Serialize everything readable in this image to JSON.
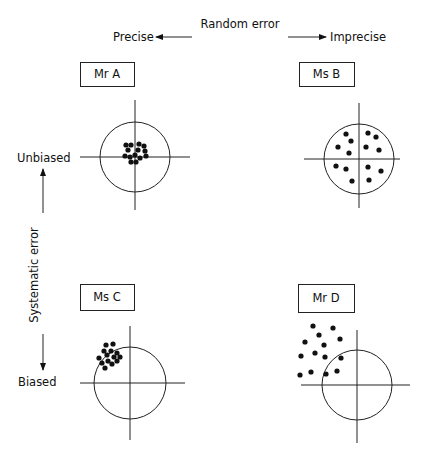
{
  "title": "Random error",
  "axes": {
    "random_error": {
      "label": "Random error",
      "left": "Precise",
      "right": "Imprecise"
    },
    "systematic_error": {
      "label": "Systematic error",
      "top": "Unbiased",
      "bottom": "Biased"
    }
  },
  "colors": {
    "ink": "#111111",
    "background": "#ffffff"
  },
  "panels": [
    {
      "id": "mr-a",
      "label": "Mr A",
      "description": "Precise, unbiased",
      "box": [
        80,
        62,
        54,
        24
      ],
      "target": {
        "cx": 135,
        "cy": 157,
        "r": 35,
        "h": [
          80,
          190
        ],
        "v": [
          100,
          210
        ]
      },
      "dots": [
        [
          126,
          145
        ],
        [
          131,
          145
        ],
        [
          139,
          144
        ],
        [
          144,
          146
        ],
        [
          128,
          150
        ],
        [
          138,
          150
        ],
        [
          145,
          151
        ],
        [
          125,
          156
        ],
        [
          130,
          157
        ],
        [
          135,
          155
        ],
        [
          140,
          158
        ],
        [
          146,
          156
        ],
        [
          131,
          162
        ],
        [
          136,
          162
        ]
      ]
    },
    {
      "id": "ms-b",
      "label": "Ms B",
      "description": "Imprecise, unbiased",
      "box": [
        299,
        62,
        55,
        24
      ],
      "target": {
        "cx": 359,
        "cy": 159,
        "r": 35,
        "h": [
          304,
          400
        ],
        "v": [
          103,
          208
        ]
      },
      "dots": [
        [
          346,
          134
        ],
        [
          351,
          141
        ],
        [
          338,
          147
        ],
        [
          349,
          153
        ],
        [
          368,
          133
        ],
        [
          376,
          137
        ],
        [
          366,
          147
        ],
        [
          379,
          150
        ],
        [
          336,
          166
        ],
        [
          346,
          169
        ],
        [
          368,
          167
        ],
        [
          381,
          171
        ],
        [
          352,
          181
        ],
        [
          369,
          180
        ]
      ]
    },
    {
      "id": "ms-c",
      "label": "Ms C",
      "description": "Precise, biased",
      "box": [
        80,
        284,
        54,
        26
      ],
      "target": {
        "cx": 130,
        "cy": 383,
        "r": 36,
        "h": [
          80,
          185
        ],
        "v": [
          326,
          440
        ]
      },
      "dots": [
        [
          106,
          345
        ],
        [
          113,
          344
        ],
        [
          104,
          351
        ],
        [
          111,
          351
        ],
        [
          117,
          353
        ],
        [
          99,
          358
        ],
        [
          107,
          355
        ],
        [
          114,
          357
        ],
        [
          102,
          363
        ],
        [
          108,
          361
        ],
        [
          117,
          361
        ],
        [
          120,
          357
        ],
        [
          105,
          368
        ],
        [
          112,
          364
        ]
      ]
    },
    {
      "id": "mr-d",
      "label": "Mr D",
      "description": "Imprecise, biased",
      "box": [
        298,
        284,
        56,
        28
      ],
      "target": {
        "cx": 357,
        "cy": 385,
        "r": 35,
        "h": [
          301,
          410
        ],
        "v": [
          330,
          443
        ]
      },
      "dots": [
        [
          313,
          326
        ],
        [
          333,
          328
        ],
        [
          319,
          335
        ],
        [
          340,
          339
        ],
        [
          305,
          342
        ],
        [
          324,
          345
        ],
        [
          301,
          356
        ],
        [
          315,
          353
        ],
        [
          325,
          357
        ],
        [
          341,
          358
        ],
        [
          300,
          375
        ],
        [
          311,
          372
        ],
        [
          326,
          374
        ],
        [
          337,
          371
        ]
      ]
    }
  ]
}
